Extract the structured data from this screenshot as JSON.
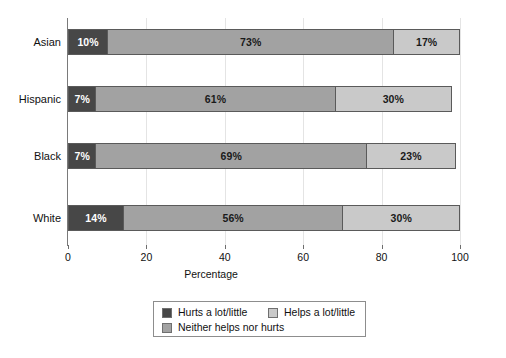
{
  "chart_data": {
    "type": "bar",
    "orientation": "horizontal",
    "stacked": true,
    "title": "",
    "xlabel": "Percentage",
    "ylabel": "",
    "xlim": [
      0,
      100
    ],
    "xticks": [
      0,
      20,
      40,
      60,
      80,
      100
    ],
    "xtick_labels": [
      "0",
      "20",
      "40",
      "60",
      "80",
      "100"
    ],
    "grid": true,
    "grid_axis": "x",
    "legend_position": "bottom",
    "categories": [
      "Asian",
      "Hispanic",
      "Black",
      "White"
    ],
    "series": [
      {
        "name": "Hurts a lot/little",
        "color": "#474747",
        "values": [
          10,
          7,
          7,
          14
        ],
        "labels": [
          "10%",
          "7%",
          "7%",
          "14%"
        ]
      },
      {
        "name": "Neither helps nor hurts",
        "color": "#a2a2a2",
        "values": [
          73,
          61,
          69,
          56
        ],
        "labels": [
          "73%",
          "61%",
          "69%",
          "56%"
        ]
      },
      {
        "name": "Helps a lot/little",
        "color": "#c9c9c9",
        "values": [
          17,
          30,
          23,
          30
        ],
        "labels": [
          "17%",
          "30%",
          "23%",
          "30%"
        ]
      }
    ],
    "rows": [
      {
        "category": "Asian",
        "segments": [
          {
            "series": "Hurts a lot/little",
            "value": 10,
            "label": "10%",
            "tone": "dark"
          },
          {
            "series": "Neither helps nor hurts",
            "value": 73,
            "label": "73%",
            "tone": "mid"
          },
          {
            "series": "Helps a lot/little",
            "value": 17,
            "label": "17%",
            "tone": "light"
          }
        ]
      },
      {
        "category": "Hispanic",
        "segments": [
          {
            "series": "Hurts a lot/little",
            "value": 7,
            "label": "7%",
            "tone": "dark"
          },
          {
            "series": "Neither helps nor hurts",
            "value": 61,
            "label": "61%",
            "tone": "mid"
          },
          {
            "series": "Helps a lot/little",
            "value": 30,
            "label": "30%",
            "tone": "light"
          }
        ]
      },
      {
        "category": "Black",
        "segments": [
          {
            "series": "Hurts a lot/little",
            "value": 7,
            "label": "7%",
            "tone": "dark"
          },
          {
            "series": "Neither helps nor hurts",
            "value": 69,
            "label": "69%",
            "tone": "mid"
          },
          {
            "series": "Helps a lot/little",
            "value": 23,
            "label": "23%",
            "tone": "light"
          }
        ]
      },
      {
        "category": "White",
        "segments": [
          {
            "series": "Hurts a lot/little",
            "value": 14,
            "label": "14%",
            "tone": "dark"
          },
          {
            "series": "Neither helps nor hurts",
            "value": 56,
            "label": "56%",
            "tone": "mid"
          },
          {
            "series": "Helps a lot/little",
            "value": 30,
            "label": "30%",
            "tone": "light"
          }
        ]
      }
    ],
    "legend": [
      {
        "label": "Hurts a lot/little",
        "tone": "dark",
        "color": "#474747"
      },
      {
        "label": "Neither helps nor hurts",
        "tone": "mid",
        "color": "#a2a2a2"
      },
      {
        "label": "Helps a lot/little",
        "tone": "light",
        "color": "#c9c9c9"
      }
    ]
  },
  "colors": {
    "dark": "#474747",
    "mid": "#a2a2a2",
    "light": "#c9c9c9",
    "grid": "#e4e4e4",
    "axis": "#7a7a7a",
    "background": "#ffffff"
  }
}
